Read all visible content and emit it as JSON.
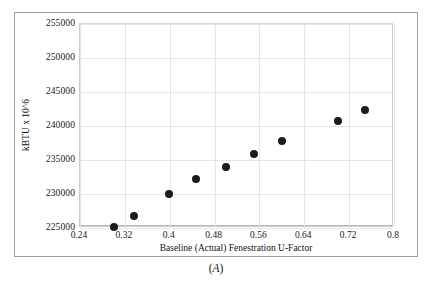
{
  "figure": {
    "caption_prefix": "(",
    "caption_letter": "A",
    "caption_suffix": ")"
  },
  "chart_data": {
    "type": "scatter",
    "title": "",
    "xlabel": "Baseline (Actual)  Fenestration U-Factor",
    "ylabel": "kBTU x 10^6",
    "xlim": [
      0.24,
      0.8
    ],
    "ylim": [
      225000,
      255000
    ],
    "xticks": [
      0.24,
      0.32,
      0.4,
      0.48,
      0.56,
      0.64,
      0.72,
      0.8
    ],
    "xtick_labels": [
      "0.24",
      "0.32",
      "0.4",
      "0.48",
      "0.56",
      "0.64",
      "0.72",
      "0.8"
    ],
    "yticks": [
      225000,
      230000,
      235000,
      240000,
      245000,
      250000,
      255000
    ],
    "ytick_labels": [
      "225000",
      "230000",
      "235000",
      "240000",
      "245000",
      "250000",
      "255000"
    ],
    "grid": true,
    "legend": null,
    "marker": {
      "shape": "circle",
      "color": "#1c1c1c",
      "size": 8
    },
    "points": [
      {
        "x": 0.3,
        "y": 225100
      },
      {
        "x": 0.336,
        "y": 226800
      },
      {
        "x": 0.398,
        "y": 230000
      },
      {
        "x": 0.446,
        "y": 232200
      },
      {
        "x": 0.5,
        "y": 234000
      },
      {
        "x": 0.55,
        "y": 235900
      },
      {
        "x": 0.6,
        "y": 237800
      },
      {
        "x": 0.7,
        "y": 240700
      },
      {
        "x": 0.748,
        "y": 242300
      }
    ]
  }
}
